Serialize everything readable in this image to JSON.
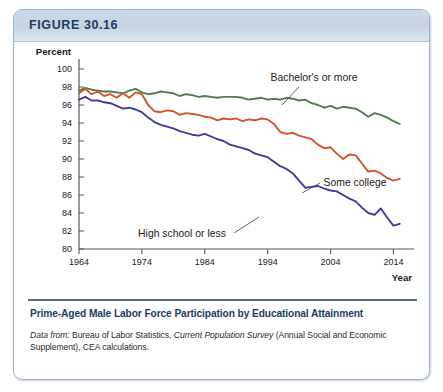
{
  "figure": {
    "number": "FIGURE 30.16",
    "caption": "Prime-Aged Male Labor Force Participation by Educational Attainment",
    "source_prefix": "Data from:",
    "source_rest_1": " Bureau of Labor Statistics, ",
    "source_italic_2": "Current Population Survey",
    "source_rest_2": " (Annual Social and Economic Supplement), CEA calculations."
  },
  "chart_data": {
    "type": "line",
    "title": "Prime-Aged Male Labor Force Participation by Educational Attainment",
    "xlabel": "Year",
    "ylabel": "Percent",
    "xlim": [
      1964,
      2016
    ],
    "ylim": [
      80,
      100
    ],
    "xticks": [
      1964,
      1974,
      1984,
      1994,
      2004,
      2014
    ],
    "xticklabels": [
      "1964",
      "1974",
      "1984",
      "1994",
      "2004",
      "2014"
    ],
    "yticks": [
      80,
      82,
      84,
      86,
      88,
      90,
      92,
      94,
      96,
      98,
      100
    ],
    "yticklabels": [
      "80",
      "82",
      "84",
      "86",
      "88",
      "90",
      "92",
      "94",
      "96",
      "98",
      "100"
    ],
    "grid": false,
    "legend": "inline-annotations",
    "x": [
      1964,
      1965,
      1966,
      1967,
      1968,
      1969,
      1970,
      1971,
      1972,
      1973,
      1974,
      1975,
      1976,
      1977,
      1978,
      1979,
      1980,
      1981,
      1982,
      1983,
      1984,
      1985,
      1986,
      1987,
      1988,
      1989,
      1990,
      1991,
      1992,
      1993,
      1994,
      1995,
      1996,
      1997,
      1998,
      1999,
      2000,
      2001,
      2002,
      2003,
      2004,
      2005,
      2006,
      2007,
      2008,
      2009,
      2010,
      2011,
      2012,
      2013,
      2014,
      2015
    ],
    "series": [
      {
        "name": "Bachelor's or more",
        "color": "#4d7d4f",
        "label_text": "Bachelor's or more",
        "values": [
          97.6,
          97.9,
          97.7,
          97.6,
          97.5,
          97.5,
          97.4,
          97.3,
          97.6,
          97.8,
          97.4,
          97.2,
          97.3,
          97.5,
          97.4,
          97.3,
          97.0,
          97.2,
          97.1,
          96.9,
          97.0,
          96.9,
          96.8,
          96.9,
          96.9,
          96.9,
          96.8,
          96.6,
          96.7,
          96.8,
          96.6,
          96.7,
          96.6,
          96.8,
          96.7,
          96.5,
          96.6,
          96.2,
          96.0,
          95.7,
          95.9,
          95.6,
          95.8,
          95.7,
          95.6,
          95.2,
          94.7,
          95.1,
          94.9,
          94.6,
          94.2,
          93.9
        ]
      },
      {
        "name": "Some college",
        "color": "#d2542a",
        "label_text": "Some college",
        "values": [
          97.3,
          97.8,
          97.2,
          97.5,
          97.0,
          97.2,
          96.8,
          97.3,
          96.8,
          97.4,
          97.2,
          96.0,
          95.3,
          95.2,
          95.4,
          95.3,
          94.9,
          95.1,
          95.0,
          94.9,
          94.7,
          94.6,
          94.3,
          94.5,
          94.4,
          94.5,
          94.2,
          94.4,
          94.3,
          94.5,
          94.4,
          93.9,
          93.0,
          92.8,
          92.9,
          92.6,
          92.4,
          92.2,
          91.6,
          91.2,
          91.3,
          90.6,
          90.0,
          90.5,
          90.4,
          89.5,
          88.6,
          88.7,
          88.4,
          87.9,
          87.6,
          87.8
        ]
      },
      {
        "name": "High school or less",
        "color": "#46389a",
        "label_text": "High school or less",
        "values": [
          96.6,
          96.9,
          96.5,
          96.5,
          96.3,
          96.2,
          95.9,
          95.6,
          95.7,
          95.5,
          95.2,
          94.6,
          94.1,
          93.8,
          93.6,
          93.4,
          93.1,
          92.9,
          92.7,
          92.6,
          92.8,
          92.5,
          92.2,
          92.0,
          91.6,
          91.4,
          91.2,
          91.0,
          90.6,
          90.4,
          90.2,
          89.7,
          89.2,
          88.9,
          88.4,
          87.6,
          86.8,
          86.9,
          87.0,
          86.7,
          86.5,
          86.4,
          86.0,
          85.6,
          85.3,
          84.6,
          84.0,
          83.8,
          84.5,
          83.5,
          82.6,
          82.8
        ]
      }
    ]
  }
}
